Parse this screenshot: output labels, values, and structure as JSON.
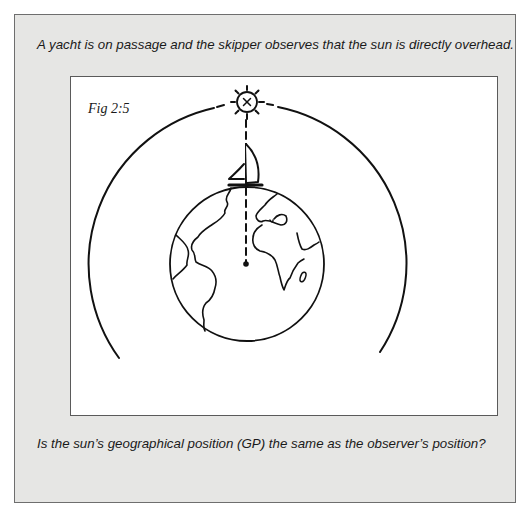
{
  "card": {
    "prompt": "A yacht is on passage and the skipper observes that the sun is directly overhead.",
    "question": "Is the sun’s geographical position (GP) the same as the observer’s position?"
  },
  "figure": {
    "label": "Fig 2:5",
    "sun_symbol": "X",
    "elements": [
      "sun-icon",
      "yacht-icon",
      "globe-icon",
      "celestial-arc",
      "zenith-line",
      "earth-center-dot"
    ]
  },
  "colors": {
    "card_background": "#e6e6e4",
    "panel_background": "#ffffff",
    "ink": "#1a1a1a",
    "border": "#6e6e6e"
  }
}
